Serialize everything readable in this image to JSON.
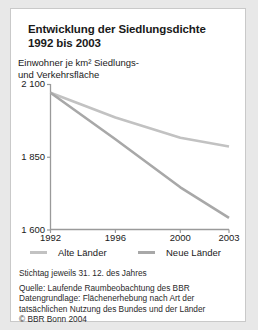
{
  "card": {
    "title_line1": "Entwicklung der Siedlungsdichte",
    "title_line2": "1992 bis 2003",
    "axis_caption_line1": "Einwohner je km² Siedlungs-",
    "axis_caption_line2": "und Verkehrsfläche"
  },
  "legend": {
    "items": [
      {
        "label": "Alte Länder",
        "color": "#c2c2c2"
      },
      {
        "label": "Neue Länder",
        "color": "#a8a8a8"
      }
    ]
  },
  "footnotes": {
    "stichtag": "Stichtag jeweils 31. 12. des Jahres",
    "quelle": "Quelle: Laufende Raumbeobachtung des BBR",
    "datengrundlage1": "Datengrundlage: Flächenerhebung nach Art der",
    "datengrundlage2": "tatsächlichen Nutzung des Bundes und der Länder",
    "copyright": "© BBR Bonn 2004"
  },
  "colors": {
    "background": "#e8e8e8",
    "card": "#ffffff",
    "axis": "#9a9a9a",
    "text": "#1a1a1a",
    "alte_laender": "#c2c2c2",
    "neue_laender": "#a8a8a8"
  },
  "chart_data": {
    "type": "line",
    "title": "Entwicklung der Siedlungsdichte 1992 bis 2003",
    "xlabel": "",
    "ylabel": "Einwohner je km² Siedlungs- und Verkehrsfläche",
    "xlim": [
      1992,
      2003
    ],
    "ylim": [
      1600,
      2100
    ],
    "yticks": [
      1600,
      1850,
      2100
    ],
    "ytick_labels": [
      "1 600",
      "1 850",
      "2 100"
    ],
    "xticks": [
      1992,
      1996,
      2000,
      2003
    ],
    "xtick_labels": [
      "1992",
      "1996",
      "2000",
      "2003"
    ],
    "grid": false,
    "legend_position": "bottom",
    "x": [
      1992,
      1996,
      2000,
      2003
    ],
    "series": [
      {
        "name": "Alte Länder",
        "color": "#c2c2c2",
        "values": [
          2070,
          1985,
          1915,
          1885
        ]
      },
      {
        "name": "Neue Länder",
        "color": "#a8a8a8",
        "values": [
          2070,
          1910,
          1745,
          1640
        ]
      }
    ]
  }
}
